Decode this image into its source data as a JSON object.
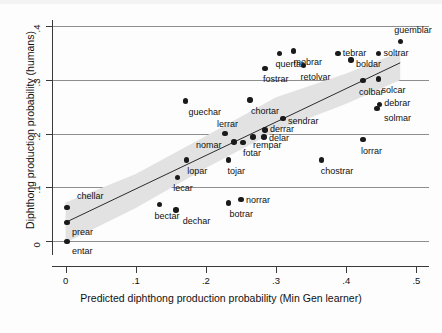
{
  "chart_data": {
    "type": "scatter",
    "title": "",
    "xlabel": "Predicted diphthong production probability (Min Gen learner)",
    "ylabel": "Diphthong production probability (humans)",
    "xlim": [
      -0.018,
      0.518
    ],
    "ylim": [
      -0.022,
      0.408
    ],
    "xticks": [
      0,
      0.1,
      0.2,
      0.3,
      0.4,
      0.5
    ],
    "xtick_labels": [
      "0",
      ".1",
      ".2",
      ".3",
      ".4",
      ".5"
    ],
    "yticks": [
      0,
      0.1,
      0.2,
      0.3,
      0.4
    ],
    "ytick_labels": [
      "0",
      ".1",
      ".2",
      ".3",
      ".4"
    ],
    "grid": "horizontal",
    "legend": "none",
    "marker_color": "#1a1a1a",
    "fit_line_color": "#2b2b2b",
    "ci_band_color": "#e2e2e2",
    "fit_line": {
      "x0": 0.0,
      "y0": 0.035,
      "x1": 0.477,
      "y1": 0.332
    },
    "ci_band": {
      "upper": [
        [
          0.0,
          0.072
        ],
        [
          0.1,
          0.125
        ],
        [
          0.2,
          0.196
        ],
        [
          0.3,
          0.268
        ],
        [
          0.4,
          0.312
        ],
        [
          0.477,
          0.352
        ]
      ],
      "lower": [
        [
          0.0,
          -0.003
        ],
        [
          0.1,
          0.062
        ],
        [
          0.2,
          0.136
        ],
        [
          0.3,
          0.205
        ],
        [
          0.4,
          0.256
        ],
        [
          0.477,
          0.3
        ]
      ]
    },
    "points": [
      {
        "label": "chellar",
        "x": 0.002,
        "y": 0.063,
        "lx": 10,
        "ly": -11
      },
      {
        "label": "prear",
        "x": 0.002,
        "y": 0.035,
        "lx": 5,
        "ly": 10
      },
      {
        "label": "entar",
        "x": 0.002,
        "y": 0.0,
        "lx": 5,
        "ly": 10
      },
      {
        "label": "bectar",
        "x": 0.134,
        "y": 0.068,
        "lx": -5,
        "ly": 11
      },
      {
        "label": "dechar",
        "x": 0.157,
        "y": 0.058,
        "lx": 7,
        "ly": 11
      },
      {
        "label": "lecar",
        "x": 0.159,
        "y": 0.119,
        "lx": -4,
        "ly": 11
      },
      {
        "label": "lopar",
        "x": 0.172,
        "y": 0.151,
        "lx": 1,
        "ly": 11
      },
      {
        "label": "guechar",
        "x": 0.171,
        "y": 0.261,
        "lx": 3,
        "ly": 11
      },
      {
        "label": "botrar",
        "x": 0.232,
        "y": 0.071,
        "lx": 1,
        "ly": 11
      },
      {
        "label": "norrar",
        "x": 0.25,
        "y": 0.078,
        "lx": 5,
        "ly": 1
      },
      {
        "label": "tojar",
        "x": 0.232,
        "y": 0.151,
        "lx": -1,
        "ly": 11
      },
      {
        "label": "lerrar",
        "x": 0.227,
        "y": 0.2,
        "lx": -8,
        "ly": -10
      },
      {
        "label": "nomar",
        "x": 0.24,
        "y": 0.185,
        "lx": -38,
        "ly": 3
      },
      {
        "label": "fotar",
        "x": 0.253,
        "y": 0.184,
        "lx": 0,
        "ly": 11
      },
      {
        "label": "rempar",
        "x": 0.267,
        "y": 0.194,
        "lx": 0,
        "ly": 8
      },
      {
        "label": "chortar",
        "x": 0.263,
        "y": 0.263,
        "lx": 1,
        "ly": 11
      },
      {
        "label": "delar",
        "x": 0.283,
        "y": 0.194,
        "lx": 5,
        "ly": 1
      },
      {
        "label": "derrar",
        "x": 0.284,
        "y": 0.207,
        "lx": 5,
        "ly": -1
      },
      {
        "label": "sendrar",
        "x": 0.31,
        "y": 0.228,
        "lx": 5,
        "ly": 2
      },
      {
        "label": "fostrar",
        "x": 0.284,
        "y": 0.322,
        "lx": -2,
        "ly": 11
      },
      {
        "label": "quertar",
        "x": 0.305,
        "y": 0.35,
        "lx": -4,
        "ly": 11
      },
      {
        "label": "mobrar",
        "x": 0.325,
        "y": 0.354,
        "lx": 0,
        "ly": 11
      },
      {
        "label": "retolvar",
        "x": 0.339,
        "y": 0.327,
        "lx": -3,
        "ly": 11
      },
      {
        "label": "chostrar",
        "x": 0.365,
        "y": 0.151,
        "lx": -1,
        "ly": 11
      },
      {
        "label": "tebrar",
        "x": 0.388,
        "y": 0.35,
        "lx": 5,
        "ly": 0
      },
      {
        "label": "boldar",
        "x": 0.407,
        "y": 0.337,
        "lx": 5,
        "ly": 4
      },
      {
        "label": "lorrar",
        "x": 0.424,
        "y": 0.189,
        "lx": -2,
        "ly": 11
      },
      {
        "label": "colbar",
        "x": 0.424,
        "y": 0.299,
        "lx": -4,
        "ly": 11
      },
      {
        "label": "solcar",
        "x": 0.446,
        "y": 0.302,
        "lx": 3,
        "ly": 11
      },
      {
        "label": "soltrar",
        "x": 0.446,
        "y": 0.35,
        "lx": 5,
        "ly": 0
      },
      {
        "label": "debrar",
        "x": 0.447,
        "y": 0.254,
        "lx": 5,
        "ly": -2
      },
      {
        "label": "solmar",
        "x": 0.444,
        "y": 0.247,
        "lx": 7,
        "ly": 9
      },
      {
        "label": "guemblar",
        "x": 0.477,
        "y": 0.372,
        "lx": -6,
        "ly": -11
      }
    ]
  },
  "footer": {
    "cropped_text": ""
  }
}
